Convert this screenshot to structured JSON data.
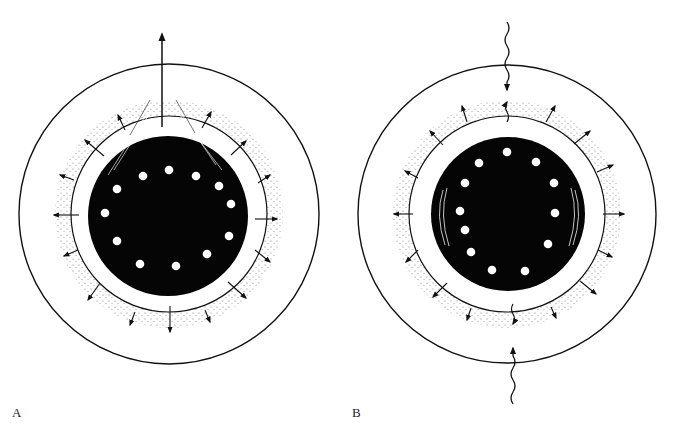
{
  "figure": {
    "panels": [
      {
        "id": "A",
        "label": "A",
        "center": [
          169,
          214
        ],
        "outer_radius": 150,
        "inner_radius": 98,
        "core_radius": 80,
        "pores": [
          [
            169,
            170
          ],
          [
            196,
            176
          ],
          [
            219,
            186
          ],
          [
            231,
            204
          ],
          [
            229,
            236
          ],
          [
            207,
            254
          ],
          [
            176,
            266
          ],
          [
            140,
            264
          ],
          [
            117,
            241
          ],
          [
            105,
            213
          ],
          [
            117,
            189
          ],
          [
            143,
            176
          ]
        ],
        "top_arrow": {
          "type": "straight",
          "from": [
            162,
            127
          ],
          "to": [
            162,
            32
          ]
        },
        "radial_arrow_count": 16
      },
      {
        "id": "B",
        "label": "B",
        "center": [
          507,
          214
        ],
        "outer_radius": 150,
        "inner_radius": 98,
        "core_radius": 77,
        "pores": [
          [
            507,
            152
          ],
          [
            536,
            162
          ],
          [
            554,
            183
          ],
          [
            555,
            213
          ],
          [
            548,
            244
          ],
          [
            525,
            271
          ],
          [
            492,
            270
          ],
          [
            471,
            252
          ],
          [
            465,
            230
          ],
          [
            460,
            211
          ],
          [
            465,
            183
          ],
          [
            479,
            163
          ]
        ],
        "wavy_arrows": [
          {
            "direction": "down",
            "from": [
              507,
              22
            ],
            "to": [
              507,
              95
            ]
          },
          {
            "direction": "up",
            "from": [
              513,
              404
            ],
            "to": [
              513,
              345
            ]
          }
        ],
        "radial_arrow_count": 16
      }
    ],
    "colors": {
      "ink": "#111111",
      "paper": "#ffffff",
      "stipple": "#777777"
    }
  }
}
